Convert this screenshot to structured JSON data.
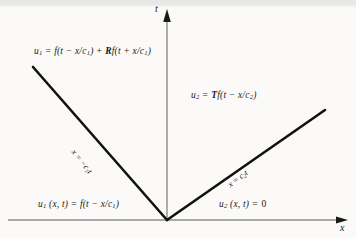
{
  "figure": {
    "type": "characteristic-diagram",
    "background_color": "#fbfaf8",
    "line_color": "#111111",
    "axis_color": "#8c8c8c"
  },
  "axes": {
    "vertical": {
      "label": "t",
      "name": "t-axis",
      "x_px": 167,
      "from_y_px": 220,
      "to_y_px": 12
    },
    "horizontal": {
      "label": "x",
      "name": "x-axis",
      "y_px": 220,
      "from_x_px": 8,
      "to_x_px": 348
    }
  },
  "characteristics": [
    {
      "name": "left-characteristic",
      "label_plain": "x = -c1 t",
      "label_parts": {
        "lhs": "x",
        "eq": " = ",
        "sign": "−",
        "speed": "c",
        "sub": "1",
        "var": "t"
      },
      "from": {
        "x": 33,
        "y": 67
      },
      "to": {
        "x": 167,
        "y": 220
      },
      "rotation_deg": 52
    },
    {
      "name": "right-characteristic",
      "label_plain": "x = c2 t",
      "label_parts": {
        "lhs": "x",
        "eq": " = ",
        "sign": "",
        "speed": "c",
        "sub": "2",
        "var": "t"
      },
      "from": {
        "x": 167,
        "y": 220
      },
      "to": {
        "x": 325,
        "y": 110
      },
      "rotation_deg": -37
    }
  ],
  "region_labels": {
    "left_top": {
      "name": "u1-reflected-solution",
      "plain": "u1 = f(t - x/c1) + Rf(t + x/c1)",
      "parts": {
        "u": "u",
        "u_sub": "1",
        "eq": " = ",
        "f1": "f(t",
        "minus": " − ",
        "xc1": "x/c",
        "xc1_sub": "1",
        "close1": ")",
        "plus": " + ",
        "R": "R",
        "f2": "f(t",
        "plus2": " + ",
        "xc2": "x/c",
        "xc2_sub": "1",
        "close2": ")"
      }
    },
    "right_top": {
      "name": "u2-transmitted-solution",
      "plain": "u2 = Tf(t - x/c2)",
      "parts": {
        "u": "u",
        "u_sub": "2",
        "eq": " = ",
        "T": "T",
        "f": "f(t",
        "minus": " − ",
        "xc": "x/c",
        "xc_sub": "2",
        "close": ")"
      }
    },
    "left_bottom": {
      "name": "u1-incident-solution",
      "plain": "u1 (x, t) = f(t - x/c1)",
      "parts": {
        "u": "u",
        "u_sub": "1",
        "args": " (x, t)",
        "eq": " = ",
        "f": "f(t",
        "minus": " − ",
        "xc": "x/c",
        "xc_sub": "1",
        "close": ")"
      }
    },
    "right_bottom": {
      "name": "u2-zero-solution",
      "plain": "u2 (x, t) = 0",
      "parts": {
        "u": "u",
        "u_sub": "2",
        "args": " (x, t)",
        "eq": " = ",
        "value": "0"
      }
    }
  }
}
